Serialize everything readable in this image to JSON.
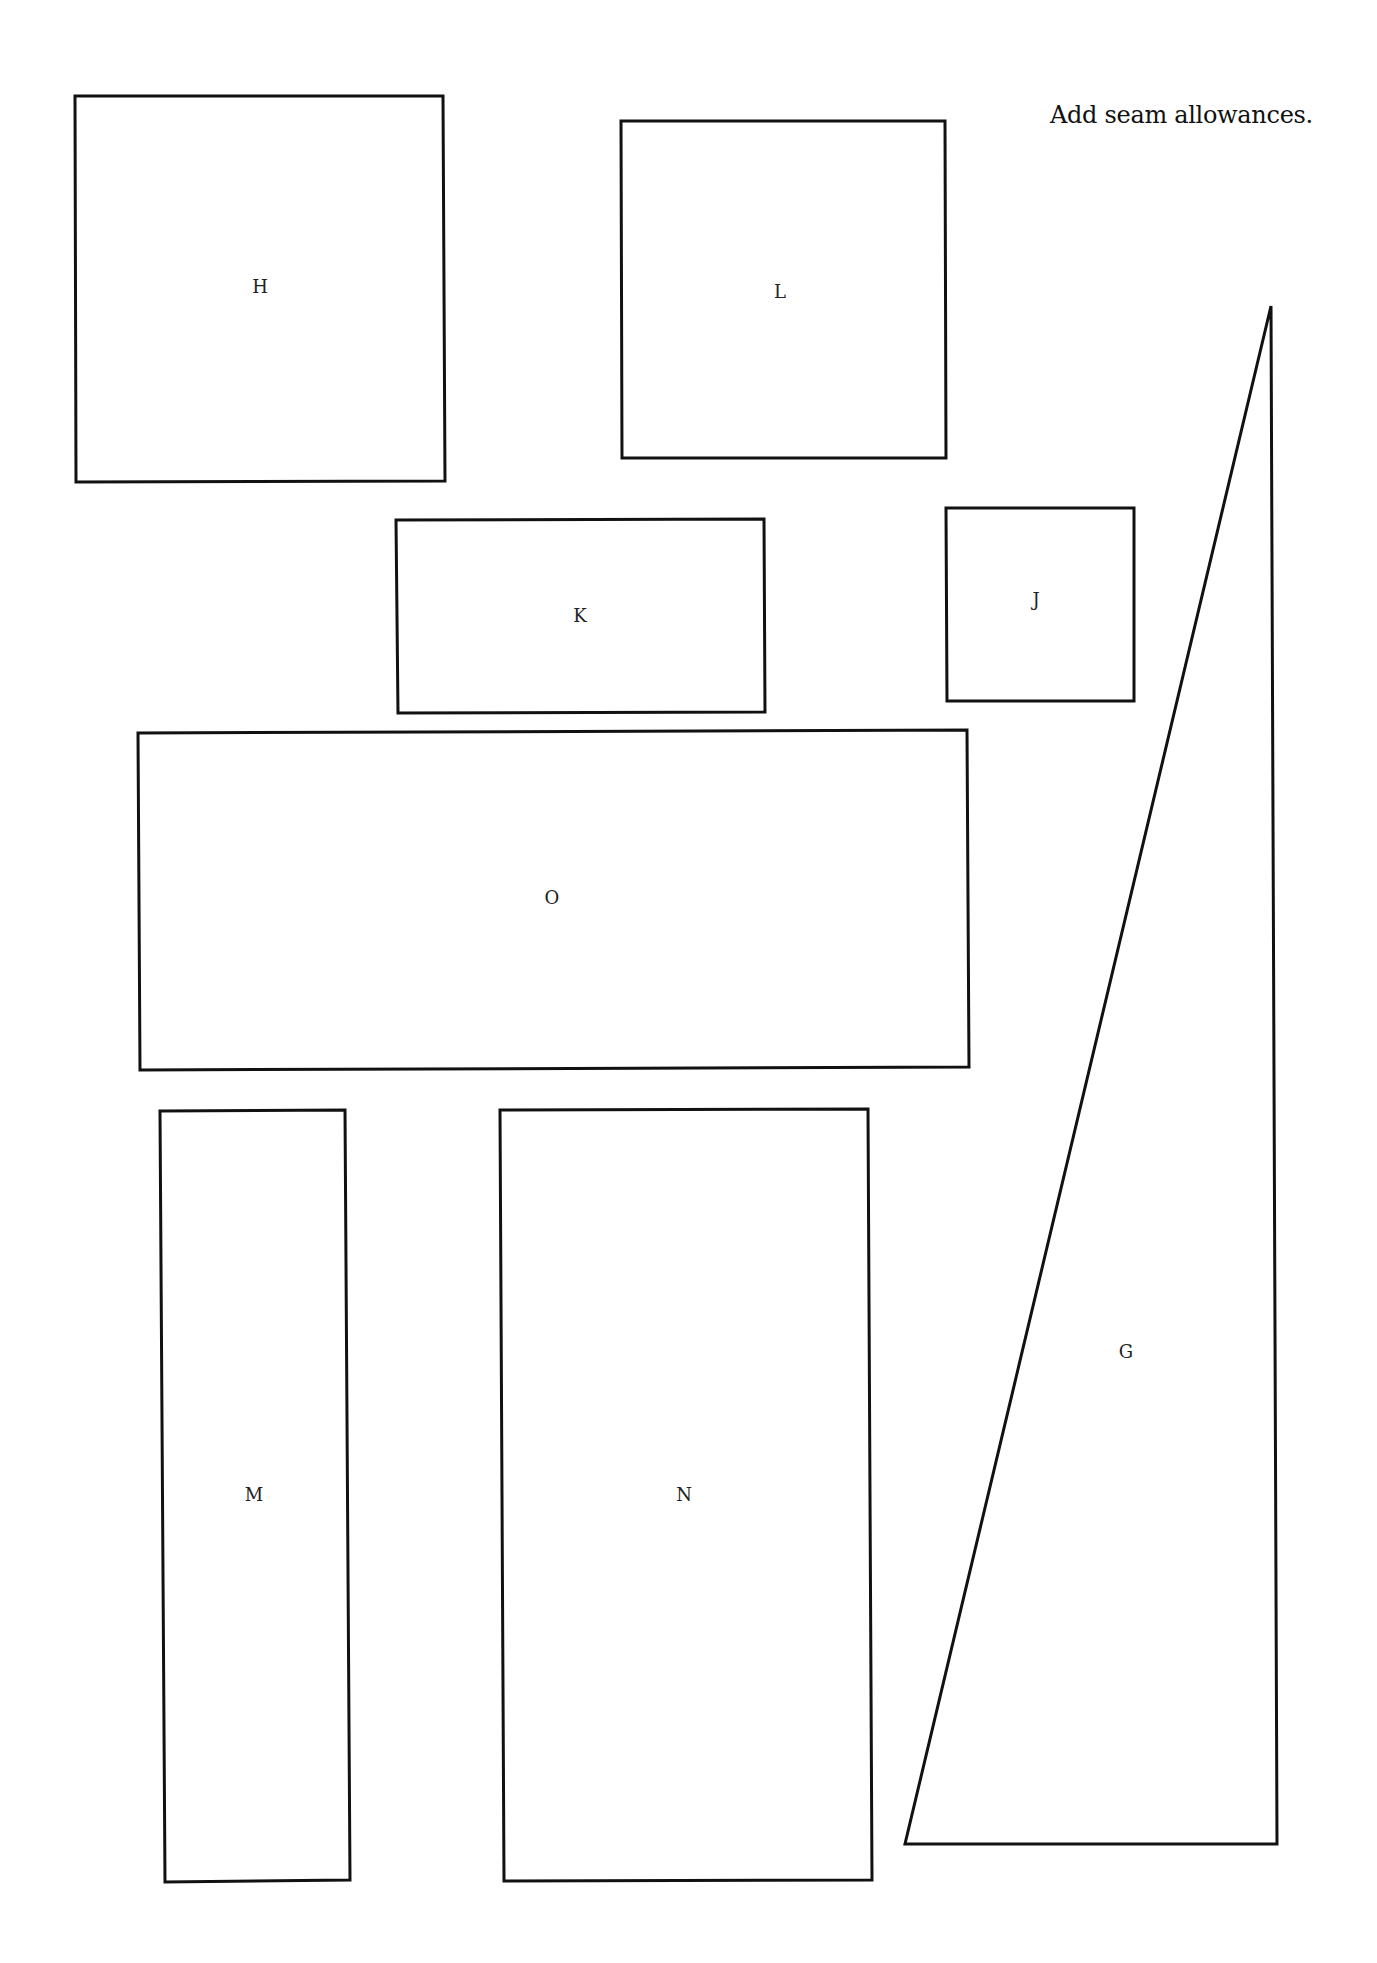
{
  "page": {
    "note": "Add seam allowances.",
    "pieces": [
      {
        "label": "H",
        "shape": "rectangle"
      },
      {
        "label": "L",
        "shape": "rectangle"
      },
      {
        "label": "K",
        "shape": "rectangle"
      },
      {
        "label": "J",
        "shape": "rectangle"
      },
      {
        "label": "O",
        "shape": "rectangle"
      },
      {
        "label": "M",
        "shape": "rectangle"
      },
      {
        "label": "N",
        "shape": "rectangle"
      },
      {
        "label": "G",
        "shape": "right-triangle"
      }
    ],
    "colors": {
      "line": "#111111",
      "background": "#ffffff"
    }
  }
}
